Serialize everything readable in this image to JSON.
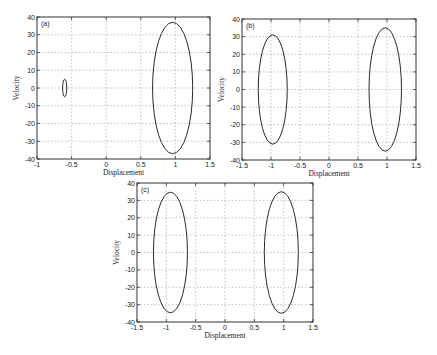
{
  "chart_data": [
    {
      "type": "line",
      "panel": "(a)",
      "title": "",
      "xlabel": "Displacement",
      "ylabel": "Velocity",
      "xlim": [
        -1,
        1.5
      ],
      "ylim": [
        -40,
        40
      ],
      "xticks": [
        -1,
        -0.5,
        0,
        0.5,
        1,
        1.5
      ],
      "xtick_labels": [
        "-1",
        "-0.5",
        "0",
        "0.5",
        "1",
        "1.5"
      ],
      "yticks": [
        -40,
        -30,
        -20,
        -10,
        0,
        10,
        20,
        30,
        40
      ],
      "ytick_labels": [
        "-40",
        "-30",
        "-20",
        "-10",
        "0",
        "10",
        "20",
        "30",
        "40"
      ],
      "grid": true,
      "box": {
        "left": 37,
        "top": 17,
        "right": 210,
        "bottom": 159
      },
      "series": [
        {
          "name": "orbit-large",
          "shape": "ellipse",
          "cx": 0.96,
          "cy": 0,
          "rx": 0.29,
          "ry": 37
        },
        {
          "name": "orbit-small",
          "shape": "ellipse",
          "cx": -0.6,
          "cy": 0,
          "rx": 0.03,
          "ry": 5
        }
      ]
    },
    {
      "type": "line",
      "panel": "(b)",
      "title": "",
      "xlabel": "Displacement",
      "ylabel": "Velocity",
      "xlim": [
        -1.5,
        1.5
      ],
      "ylim": [
        -40,
        40
      ],
      "xticks": [
        -1.5,
        -1,
        -0.5,
        0,
        0.5,
        1,
        1.5
      ],
      "xtick_labels": [
        "-1.5",
        "-1",
        "-0.5",
        "0",
        "0.5",
        "1",
        "1.5"
      ],
      "yticks": [
        -40,
        -30,
        -20,
        -10,
        0,
        10,
        20,
        30,
        40
      ],
      "ytick_labels": [
        "-40",
        "-30",
        "-20",
        "-10",
        "0",
        "10",
        "20",
        "30",
        "40"
      ],
      "grid": true,
      "box": {
        "left": 242,
        "top": 19,
        "right": 416,
        "bottom": 160
      },
      "series": [
        {
          "name": "orbit-left",
          "shape": "ellipse",
          "cx": -0.97,
          "cy": 0,
          "rx": 0.25,
          "ry": 31
        },
        {
          "name": "orbit-right",
          "shape": "ellipse",
          "cx": 0.97,
          "cy": 0,
          "rx": 0.28,
          "ry": 35
        }
      ]
    },
    {
      "type": "line",
      "panel": "(c)",
      "title": "",
      "xlabel": "Displacement",
      "ylabel": "Velocity",
      "xlim": [
        -1.5,
        1.5
      ],
      "ylim": [
        -40,
        40
      ],
      "xticks": [
        -1.5,
        -1,
        -0.5,
        0,
        0.5,
        1,
        1.5
      ],
      "xtick_labels": [
        "-1.5",
        "-1",
        "-0.5",
        "0",
        "0.5",
        "1",
        "1.5"
      ],
      "yticks": [
        -40,
        -30,
        -20,
        -10,
        0,
        10,
        20,
        30,
        40
      ],
      "ytick_labels": [
        "-40",
        "-30",
        "-20",
        "-10",
        "0",
        "10",
        "20",
        "30",
        "40"
      ],
      "grid": true,
      "box": {
        "left": 137,
        "top": 183,
        "right": 313,
        "bottom": 322
      },
      "series": [
        {
          "name": "orbit-left",
          "shape": "ellipse",
          "cx": -0.93,
          "cy": 0,
          "rx": 0.29,
          "ry": 34.7
        },
        {
          "name": "orbit-right",
          "shape": "ellipse",
          "cx": 0.96,
          "cy": 0,
          "rx": 0.29,
          "ry": 35
        }
      ]
    }
  ]
}
